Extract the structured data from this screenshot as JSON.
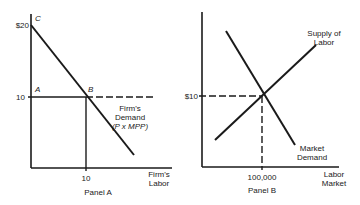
{
  "panel_a": {
    "title": "Panel A",
    "y_tick_top": "$20",
    "y_tick_mid": "10",
    "x_tick": "10",
    "x_axis_label_line1": "Firm's",
    "x_axis_label_line2": "Labor",
    "point_a": "A",
    "point_b": "B",
    "point_c": "C",
    "curve_label_line1": "Firm's",
    "curve_label_line2": "Demand",
    "curve_label_line3": "(P x MPP)"
  },
  "panel_b": {
    "title": "Panel B",
    "y_tick": "$10",
    "x_tick": "100,000",
    "x_axis_label_line1": "Labor",
    "x_axis_label_line2": "Market",
    "supply_label_line1": "Supply of",
    "supply_label_line2": "Labor",
    "demand_label_line1": "Market",
    "demand_label_line2": "Demand"
  },
  "colors": {
    "line": "#1a1a1a",
    "background": "#ffffff"
  }
}
